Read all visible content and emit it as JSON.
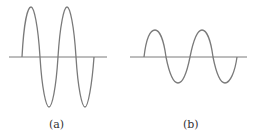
{
  "figures": [
    {
      "id": "a",
      "label": "(a)",
      "description": "sine wave, large amplitude",
      "cycles": 2,
      "amplitude": "large"
    },
    {
      "id": "b",
      "label": "(b)",
      "description": "sine wave, smaller amplitude, same frequency",
      "cycles": 2,
      "amplitude": "small"
    }
  ],
  "colors": {
    "line": "#7a7a7a",
    "axis": "#7a7a7a"
  }
}
